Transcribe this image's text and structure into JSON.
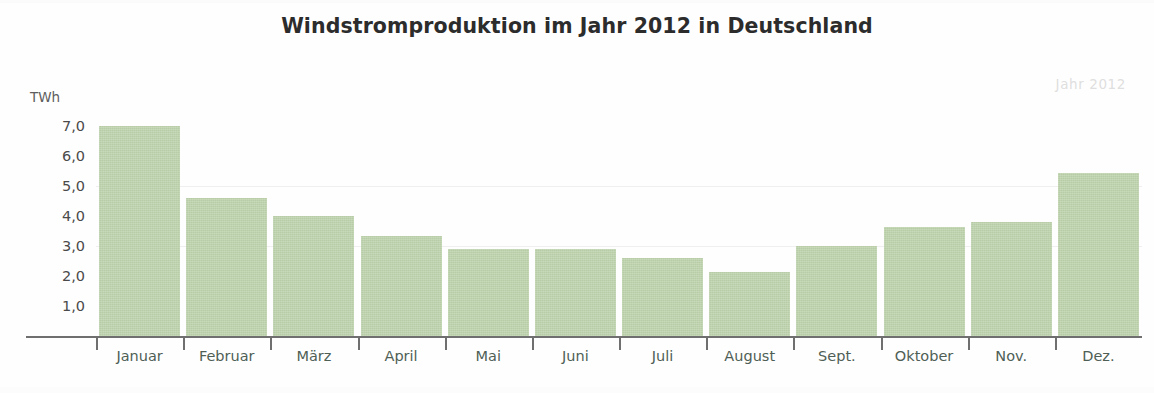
{
  "chart_data": {
    "type": "bar",
    "title": "Windstromproduktion im Jahr 2012 in Deutschland",
    "xlabel": "",
    "ylabel": "TWh",
    "unit_label": "TWh",
    "watermark": "Jahr 2012",
    "categories": [
      "Januar",
      "Februar",
      "März",
      "April",
      "Mai",
      "Juni",
      "Juli",
      "August",
      "Sept.",
      "Oktober",
      "Nov.",
      "Dez."
    ],
    "values": [
      7.0,
      4.6,
      4.0,
      3.35,
      2.9,
      2.9,
      2.6,
      2.15,
      3.0,
      3.65,
      3.8,
      5.45
    ],
    "ylim": [
      0,
      7.4
    ],
    "yticks": [
      1.0,
      2.0,
      3.0,
      4.0,
      5.0,
      6.0,
      7.0
    ],
    "ytick_labels": [
      "1,0",
      "2,0",
      "3,0",
      "4,0",
      "5,0",
      "6,0",
      "7,0"
    ],
    "grid": true,
    "gridlines_at": [
      3.0,
      5.0
    ],
    "legend": null,
    "bar_color": "#bdd2ac",
    "axis_color": "#6f6f6f",
    "grid_color": "#f0efef",
    "title_color": "#2c2c2c",
    "label_color": "#4f5f56",
    "watermark_color": "#dfdfdf"
  }
}
